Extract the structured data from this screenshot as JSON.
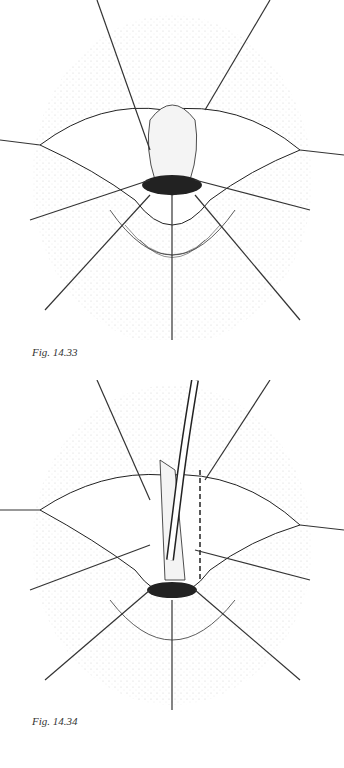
{
  "figures": [
    {
      "caption": "Fig. 14.33",
      "illustration": "surgical-illustration-retracted-tissue"
    },
    {
      "caption": "Fig. 14.34",
      "illustration": "surgical-illustration-with-catheter-and-incision-line"
    }
  ],
  "colors": {
    "line": "#222222",
    "stipple": "#555555",
    "background": "#ffffff"
  }
}
